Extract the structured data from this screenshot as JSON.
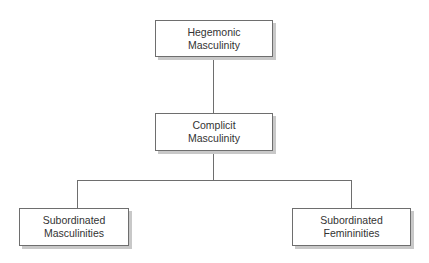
{
  "diagram": {
    "type": "hierarchy",
    "nodes": [
      {
        "id": "hegemonic",
        "line1": "Hegemonic",
        "line2": "Masculinity"
      },
      {
        "id": "complicit",
        "line1": "Complicit",
        "line2": "Masculinity"
      },
      {
        "id": "sub_masc",
        "line1": "Subordinated",
        "line2": "Masculinities"
      },
      {
        "id": "sub_fem",
        "line1": "Subordinated",
        "line2": "Femininities"
      }
    ],
    "edges": [
      {
        "from": "hegemonic",
        "to": "complicit"
      },
      {
        "from": "complicit",
        "to": "sub_masc"
      },
      {
        "from": "complicit",
        "to": "sub_fem"
      }
    ],
    "colors": {
      "stroke": "#6e6e6e",
      "shadow": "#c8c8c8",
      "text": "#333333"
    }
  }
}
